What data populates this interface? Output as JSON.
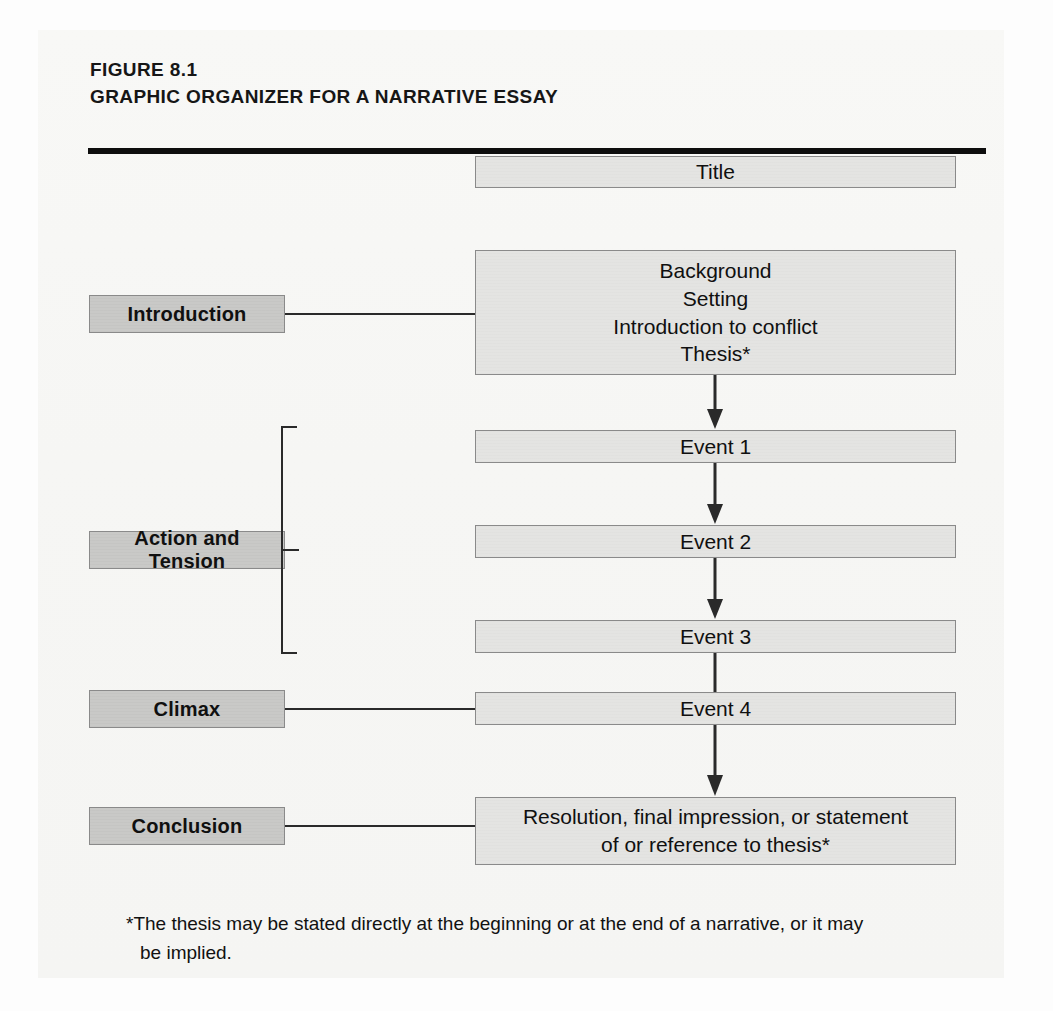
{
  "figure": {
    "number": "FIGURE 8.1",
    "title": "GRAPHIC ORGANIZER FOR A NARRATIVE ESSAY"
  },
  "colors": {
    "content_box_fill": "#e4e4e2",
    "label_box_fill": "#c9c9c7",
    "box_border": "#8a8a8a",
    "connector": "#2a2a2a",
    "rule": "#0d0d0d",
    "text": "#101010",
    "paper": "#f7f7f5"
  },
  "diagram": {
    "type": "flowchart",
    "title_box": {
      "label": "Title"
    },
    "stages": [
      {
        "id": "introduction",
        "label": "Introduction",
        "content": "Background\nSetting\nIntroduction to conflict\nThesis*",
        "connector": "line"
      },
      {
        "id": "action-and-tension",
        "label": "Action and Tension",
        "content": null,
        "connector": "bracket",
        "events": [
          {
            "label": "Event 1"
          },
          {
            "label": "Event 2"
          },
          {
            "label": "Event 3"
          }
        ]
      },
      {
        "id": "climax",
        "label": "Climax",
        "content": "Event 4",
        "connector": "line"
      },
      {
        "id": "conclusion",
        "label": "Conclusion",
        "content": "Resolution, final impression, or statement\nof or reference to thesis*",
        "connector": "line"
      }
    ],
    "flow_arrows": [
      {
        "from": "introduction",
        "to": "Event 1"
      },
      {
        "from": "Event 1",
        "to": "Event 2"
      },
      {
        "from": "Event 2",
        "to": "Event 3"
      },
      {
        "from": "Event 3",
        "to": "Event 4"
      },
      {
        "from": "Event 4",
        "to": "conclusion"
      }
    ]
  },
  "footnote": {
    "line1": "*The thesis may be stated directly at the beginning or at the end of a narrative, or it may",
    "line2": "be implied."
  }
}
